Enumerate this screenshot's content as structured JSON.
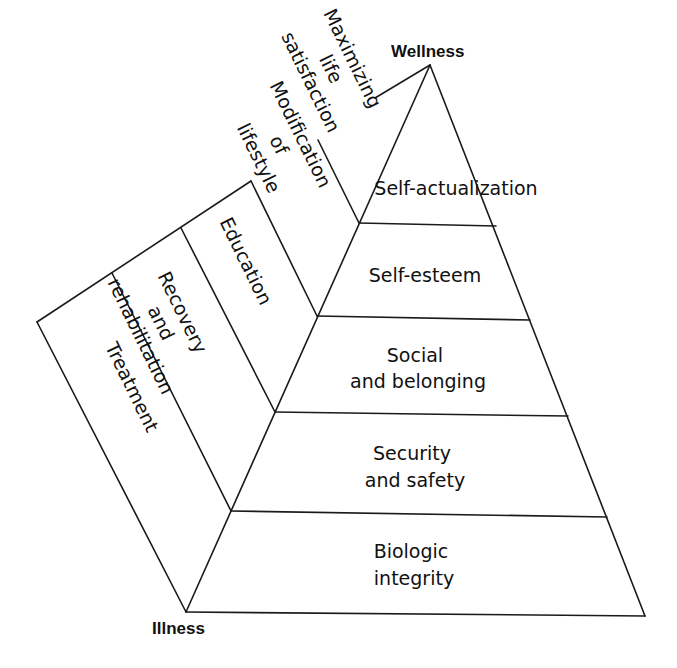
{
  "diagram": {
    "type": "wellness-illness pyramid",
    "endpoints": {
      "top": "Wellness",
      "bottom": "Illness"
    },
    "pyramid_tiers": [
      {
        "lines": [
          "Self-actualization"
        ]
      },
      {
        "lines": [
          "Self-esteem"
        ]
      },
      {
        "lines": [
          "Social",
          "and belonging"
        ]
      },
      {
        "lines": [
          "Security",
          "and safety"
        ]
      },
      {
        "lines": [
          "Biologic",
          "integrity"
        ]
      }
    ],
    "side_bands": [
      {
        "lines": [
          "Maximizing",
          "life",
          "satisfaction"
        ]
      },
      {
        "lines": [
          "Modification",
          "of",
          "lifestyle"
        ]
      },
      {
        "lines": [
          "Education"
        ]
      },
      {
        "lines": [
          "Recovery",
          "and",
          "rehabilitation"
        ]
      },
      {
        "lines": [
          "Treatment"
        ]
      }
    ],
    "colors": {
      "line": "#1a1a1a",
      "text": "#111111",
      "background": "#ffffff"
    }
  }
}
